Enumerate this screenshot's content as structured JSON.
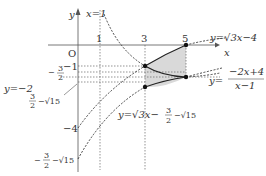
{
  "diagram": {
    "axes": {
      "x_label": "x",
      "y_label": "y",
      "origin_label": "O"
    },
    "x_ticks": [
      {
        "label": "1",
        "value": 1
      },
      {
        "label": "3",
        "value": 3
      },
      {
        "label": "5",
        "value": 5
      }
    ],
    "y_ticks": [
      {
        "label": "−1",
        "value": -1
      },
      {
        "label_num": "3",
        "label_den": "2",
        "sign": "−",
        "value": -1.5
      },
      {
        "label": "−4",
        "value": -4
      }
    ],
    "asymptotes": {
      "vertical": {
        "label": "x=1"
      },
      "horizontal": {
        "label": "y=−2"
      }
    },
    "special_values": {
      "upper": {
        "num": "3",
        "den": "2",
        "rest": "−√15"
      },
      "lower": {
        "sign": "−",
        "num": "3",
        "den": "2",
        "rest": "−√15"
      }
    },
    "curves": [
      {
        "name": "sqrt-curve",
        "label": "y=√3x−4"
      },
      {
        "name": "hyperbola",
        "label_prefix": "y=",
        "label_num": "−2x+4",
        "label_den": "x−1"
      },
      {
        "name": "shifted-sqrt",
        "label_prefix": "y=√3x−",
        "label_num": "3",
        "label_den": "2",
        "label_rest": "−√15"
      }
    ],
    "shaded_region": {
      "x_from": 3,
      "x_to": 5,
      "fill": "#d9d9d9"
    },
    "colors": {
      "axis": "#555555",
      "curve": "#222222",
      "dashed": "#444444",
      "shade": "#d9d9d9"
    }
  }
}
